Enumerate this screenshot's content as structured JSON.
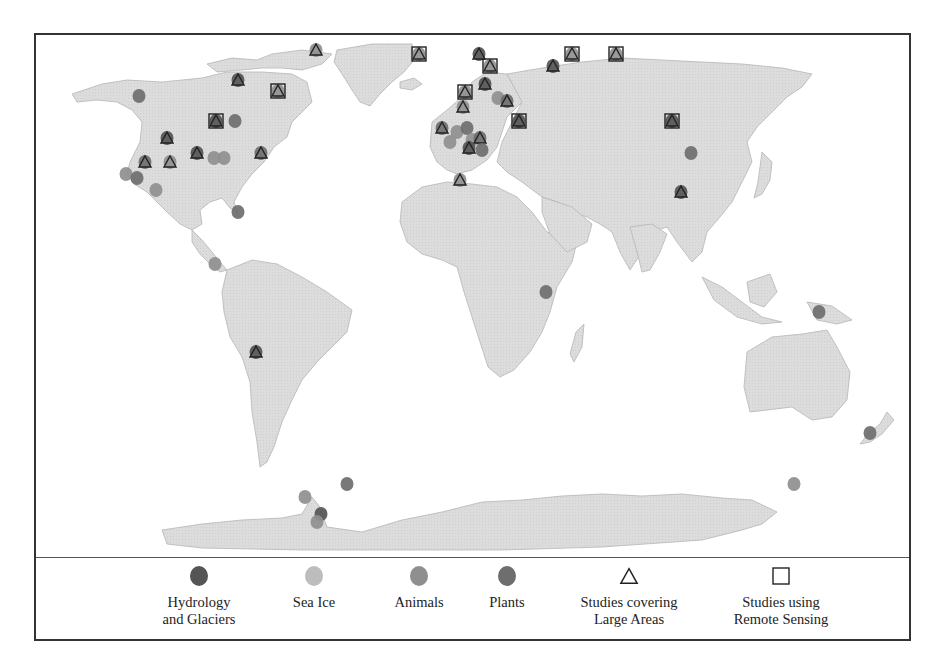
{
  "figure": {
    "type": "world-map",
    "land_color": "#d9d9d9",
    "ocean_color": "#ffffff"
  },
  "legend": {
    "items": [
      {
        "key": "hydrology",
        "label": "Hydrology\nand Glaciers",
        "symbol": "circle",
        "color": "#555555"
      },
      {
        "key": "sea_ice",
        "label": "Sea Ice",
        "symbol": "circle",
        "color": "#bdbdbd"
      },
      {
        "key": "animals",
        "label": "Animals",
        "symbol": "circle",
        "color": "#8f8f8f"
      },
      {
        "key": "plants",
        "label": "Plants",
        "symbol": "circle",
        "color": "#6e6e6e"
      },
      {
        "key": "large_areas",
        "label": "Studies covering\nLarge Areas",
        "symbol": "triangle-outline",
        "color": "#222222"
      },
      {
        "key": "remote_sensing",
        "label": "Studies using\nRemote Sensing",
        "symbol": "square-outline",
        "color": "#222222"
      }
    ]
  },
  "markers": [
    {
      "x": 137,
      "y": 94,
      "cat": "plants"
    },
    {
      "x": 236,
      "y": 78,
      "cat": "hydrology",
      "tri": true
    },
    {
      "x": 276,
      "y": 89,
      "cat": "animals",
      "tri": true,
      "sq": true
    },
    {
      "x": 314,
      "y": 48,
      "cat": "animals",
      "tri": true
    },
    {
      "x": 214,
      "y": 119,
      "cat": "hydrology",
      "tri": true,
      "sq": true
    },
    {
      "x": 233,
      "y": 119,
      "cat": "plants"
    },
    {
      "x": 165,
      "y": 136,
      "cat": "hydrology",
      "tri": true
    },
    {
      "x": 195,
      "y": 151,
      "cat": "hydrology",
      "tri": true
    },
    {
      "x": 212,
      "y": 156,
      "cat": "animals"
    },
    {
      "x": 222,
      "y": 156,
      "cat": "animals"
    },
    {
      "x": 259,
      "y": 151,
      "cat": "plants",
      "tri": true
    },
    {
      "x": 143,
      "y": 160,
      "cat": "plants",
      "tri": true
    },
    {
      "x": 168,
      "y": 160,
      "cat": "animals",
      "tri": true
    },
    {
      "x": 124,
      "y": 172,
      "cat": "animals"
    },
    {
      "x": 135,
      "y": 176,
      "cat": "plants"
    },
    {
      "x": 154,
      "y": 188,
      "cat": "animals"
    },
    {
      "x": 236,
      "y": 210,
      "cat": "plants"
    },
    {
      "x": 213,
      "y": 262,
      "cat": "animals"
    },
    {
      "x": 254,
      "y": 350,
      "cat": "hydrology",
      "tri": true
    },
    {
      "x": 417,
      "y": 52,
      "cat": "animals",
      "tri": true,
      "sq": true
    },
    {
      "x": 477,
      "y": 52,
      "cat": "hydrology",
      "tri": true
    },
    {
      "x": 488,
      "y": 64,
      "cat": "animals",
      "tri": true,
      "sq": true
    },
    {
      "x": 483,
      "y": 82,
      "cat": "hydrology",
      "tri": true
    },
    {
      "x": 463,
      "y": 90,
      "cat": "animals",
      "tri": true,
      "sq": true
    },
    {
      "x": 461,
      "y": 105,
      "cat": "animals",
      "tri": true
    },
    {
      "x": 496,
      "y": 96,
      "cat": "animals"
    },
    {
      "x": 505,
      "y": 99,
      "cat": "plants",
      "tri": true
    },
    {
      "x": 517,
      "y": 119,
      "cat": "hydrology",
      "tri": true,
      "sq": true
    },
    {
      "x": 551,
      "y": 64,
      "cat": "hydrology",
      "tri": true
    },
    {
      "x": 570,
      "y": 52,
      "cat": "animals",
      "tri": true,
      "sq": true
    },
    {
      "x": 614,
      "y": 52,
      "cat": "animals",
      "tri": true,
      "sq": true
    },
    {
      "x": 440,
      "y": 126,
      "cat": "plants",
      "tri": true
    },
    {
      "x": 455,
      "y": 130,
      "cat": "animals"
    },
    {
      "x": 465,
      "y": 126,
      "cat": "plants"
    },
    {
      "x": 470,
      "y": 138,
      "cat": "animals"
    },
    {
      "x": 478,
      "y": 136,
      "cat": "plants",
      "tri": true
    },
    {
      "x": 467,
      "y": 146,
      "cat": "hydrology",
      "tri": true
    },
    {
      "x": 480,
      "y": 148,
      "cat": "plants"
    },
    {
      "x": 448,
      "y": 140,
      "cat": "animals"
    },
    {
      "x": 458,
      "y": 178,
      "cat": "animals",
      "tri": true
    },
    {
      "x": 670,
      "y": 119,
      "cat": "hydrology",
      "tri": true,
      "sq": true
    },
    {
      "x": 689,
      "y": 151,
      "cat": "plants"
    },
    {
      "x": 679,
      "y": 190,
      "cat": "hydrology",
      "tri": true
    },
    {
      "x": 544,
      "y": 290,
      "cat": "plants"
    },
    {
      "x": 817,
      "y": 310,
      "cat": "plants"
    },
    {
      "x": 868,
      "y": 431,
      "cat": "plants"
    },
    {
      "x": 345,
      "y": 482,
      "cat": "plants"
    },
    {
      "x": 303,
      "y": 495,
      "cat": "animals"
    },
    {
      "x": 319,
      "y": 512,
      "cat": "hydrology"
    },
    {
      "x": 315,
      "y": 520,
      "cat": "animals"
    },
    {
      "x": 792,
      "y": 482,
      "cat": "animals"
    }
  ]
}
